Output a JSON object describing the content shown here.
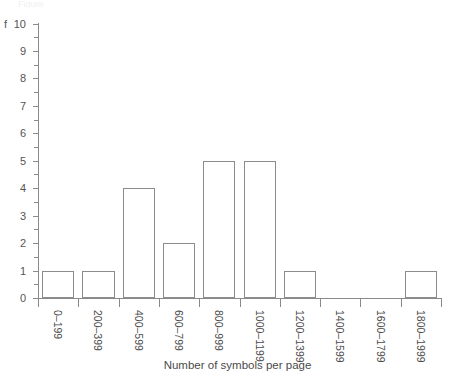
{
  "chart_data": {
    "type": "bar",
    "title": "",
    "subtitle": "",
    "xlabel": "Number of symbols per page",
    "ylabel": "f",
    "categories": [
      "0–199",
      "200–399",
      "400–599",
      "600–799",
      "800–999",
      "1000–1199",
      "1200–1399",
      "1400–1599",
      "1600–1799",
      "1800–1999"
    ],
    "values": [
      1,
      1,
      4,
      2,
      5,
      5,
      1,
      0,
      0,
      1
    ],
    "ylim": [
      0,
      10
    ],
    "ytick_labels": [
      "0",
      "1",
      "2",
      "3",
      "4",
      "5",
      "6",
      "7",
      "8",
      "9",
      "10"
    ],
    "ytick_values": [
      0,
      1,
      2,
      3,
      4,
      5,
      6,
      7,
      8,
      9,
      10
    ],
    "minor_ticks": true,
    "grid": false,
    "legend": false,
    "legend_position": "none",
    "bar_fill_color": "#ffffff",
    "bar_edge_color": "#8c8c8c",
    "axis_color": "#8a8a8a",
    "text_color": "#4a4a4a",
    "xtick_label_rotation": 90
  },
  "top_sliver_text": "Figure"
}
